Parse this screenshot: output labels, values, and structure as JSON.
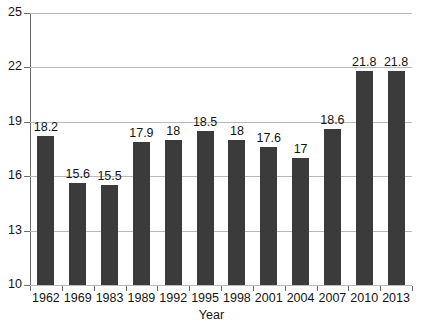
{
  "chart_data": {
    "type": "bar",
    "title": "",
    "subtitle": "",
    "xlabel": "Year",
    "ylabel": "",
    "categories": [
      "1962",
      "1969",
      "1983",
      "1989",
      "1992",
      "1995",
      "1998",
      "2001",
      "2004",
      "2007",
      "2010",
      "2013"
    ],
    "values": [
      18.2,
      15.6,
      15.5,
      17.9,
      18,
      18.5,
      18,
      17.6,
      17,
      18.6,
      21.8,
      21.8
    ],
    "data_labels": [
      "18.2",
      "15.6",
      "15.5",
      "17.9",
      "18",
      "18.5",
      "18",
      "17.6",
      "17",
      "18.6",
      "21.8",
      "21.8"
    ],
    "ylim": [
      10,
      25
    ],
    "yticks": [
      10,
      13,
      16,
      19,
      22,
      25
    ],
    "ytick_labels": [
      "10",
      "13",
      "16",
      "19",
      "22",
      "25"
    ],
    "grid": true,
    "grid_axis": "y",
    "legend": "none",
    "series": [
      {
        "name": "",
        "values": [
          18.2,
          15.6,
          15.5,
          17.9,
          18,
          18.5,
          18,
          17.6,
          17,
          18.6,
          21.8,
          21.8
        ],
        "color": "#3b3b3b"
      }
    ]
  },
  "colors": {
    "bar": "#3b3b3b",
    "grid": "#b9b9b9",
    "axis": "#6d6d6d",
    "text": "#141414",
    "background": "#ffffff"
  },
  "footer": {
    "ghost_text": ""
  }
}
